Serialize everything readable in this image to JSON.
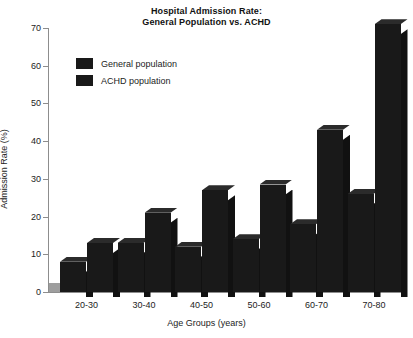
{
  "chart_data": {
    "type": "bar",
    "title": "Hospital Admission Rate: General Population vs. ACHD",
    "title_lines": [
      "Hospital Admission Rate:",
      "General Population vs. ACHD"
    ],
    "xlabel": "Age Groups (years)",
    "ylabel": "Admission Rate (%)",
    "categories": [
      "20-30",
      "30-40",
      "40-50",
      "50-60",
      "60-70",
      "70-80"
    ],
    "series": [
      {
        "name": "General population",
        "color": "#191919",
        "values": [
          8,
          13,
          12,
          14,
          18,
          26
        ]
      },
      {
        "name": "ACHD population",
        "color": "#191919",
        "values": [
          13,
          21,
          27,
          28.5,
          43,
          71
        ]
      }
    ],
    "yticks": [
      0,
      10,
      20,
      30,
      40,
      50,
      60,
      70
    ],
    "ylim": [
      0,
      72
    ],
    "grid": false,
    "legend_position": "upper-left-inside",
    "style": "3d-bar"
  },
  "colors": {
    "bar_front": "#191919",
    "bar_side": "#111111",
    "bar_top": "#2b2b2b",
    "axis": "#8d8d8d",
    "floor_band": "#9e9e9e",
    "background": "#ffffff",
    "text": "#1c1c1c"
  }
}
